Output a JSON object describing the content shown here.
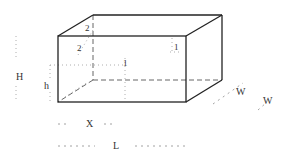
{
  "diagram": {
    "type": "isometric-box-dimension-drawing",
    "labels": {
      "top_offset_back": "2",
      "top_offset_front": "2",
      "inner_mark_left": "1",
      "inner_mark_right": "1",
      "height_total": "H",
      "height_partial": "h",
      "offset_x": "X",
      "length": "L",
      "width_inner": "W",
      "width_outer": "W"
    },
    "colors": {
      "outline": "#222222",
      "hidden": "#555555",
      "dimension": "#8a8a8a",
      "text": "#333333",
      "background": "#ffffff"
    }
  }
}
